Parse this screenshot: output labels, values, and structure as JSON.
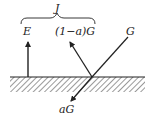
{
  "diagram": {
    "title": "",
    "labels": {
      "J": "J",
      "E": "E",
      "reflected": "(1−a)G",
      "incident": "G",
      "absorbed": "aG"
    },
    "colors": {
      "line": "#222222",
      "hatch": "#555555",
      "background": "#ffffff"
    }
  }
}
